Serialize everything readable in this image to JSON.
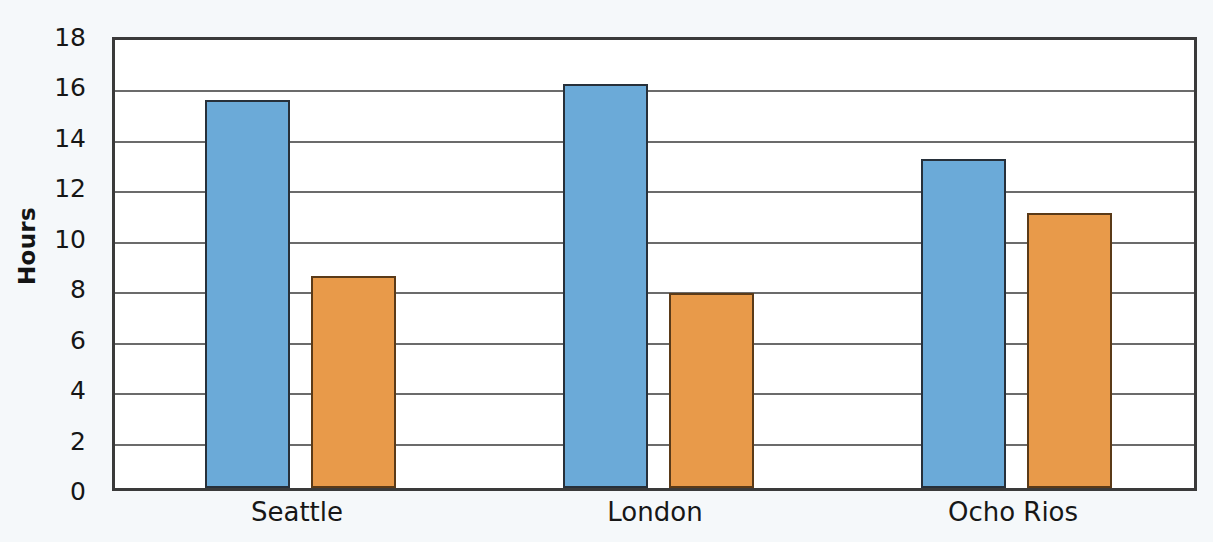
{
  "chart_data": {
    "type": "bar",
    "title": "",
    "xlabel": "",
    "ylabel": "Hours",
    "categories": [
      "Seattle",
      "London",
      "Ocho Rios"
    ],
    "series": [
      {
        "name": "Series 1",
        "color": "#6baad8",
        "values": [
          15.4,
          16.0,
          13.05
        ]
      },
      {
        "name": "Series 2",
        "color": "#e89a4a",
        "values": [
          8.4,
          7.75,
          10.9
        ]
      }
    ],
    "ylim": [
      0,
      18
    ],
    "ytick_step": 2,
    "yticks": [
      0,
      2,
      4,
      6,
      8,
      10,
      12,
      14,
      16,
      18
    ],
    "ytick_labels": [
      "0",
      "2",
      "4",
      "6",
      "8",
      "10",
      "12",
      "14",
      "16",
      "18"
    ],
    "grid": true,
    "grid_axis": "y",
    "legend": false,
    "legend_position": "none",
    "background_color": "#f5f8fa",
    "plot_background_color": "#ffffff",
    "axis_color": "#3a3a3a",
    "gridline_color": "#6b6b6b"
  },
  "layout": {
    "plot": {
      "left": 112,
      "top": 37,
      "width": 1085,
      "height": 454
    },
    "group_centers": [
      297,
      655,
      1013
    ],
    "bar_width": 85,
    "bar_gap": 21
  }
}
